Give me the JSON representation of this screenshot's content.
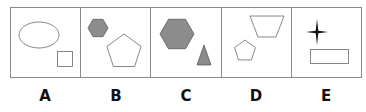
{
  "figure": {
    "type": "shape-sequence-puzzle",
    "frame": {
      "x": 10,
      "y": 7,
      "width": 351,
      "height": 70,
      "stroke": "#888888"
    },
    "colors": {
      "outline": "#7a7a7a",
      "fill_gray": "#8c8c8c",
      "fill_dark_outline": "#5a5a5a",
      "star": "#111111"
    },
    "panels": [
      {
        "label": "A",
        "shapes": [
          {
            "kind": "ellipse",
            "fill": "none",
            "cx": 29,
            "cy": 28,
            "rx": 20,
            "ry": 13
          },
          {
            "kind": "square",
            "fill": "none",
            "x": 47,
            "y": 44,
            "size": 15
          }
        ]
      },
      {
        "label": "B",
        "shapes": [
          {
            "kind": "hexagon",
            "fill": "gray",
            "cx": 18,
            "cy": 21,
            "r": 10
          },
          {
            "kind": "pentagon",
            "fill": "none",
            "cx": 44,
            "cy": 45,
            "r": 18
          }
        ]
      },
      {
        "label": "C",
        "shapes": [
          {
            "kind": "hexagon",
            "fill": "gray",
            "cx": 27,
            "cy": 27,
            "r": 17
          },
          {
            "kind": "triangle",
            "fill": "gray",
            "points": [
              [
                54,
                38
              ],
              [
                47,
                58
              ],
              [
                61,
                58
              ]
            ]
          }
        ]
      },
      {
        "label": "D",
        "shapes": [
          {
            "kind": "trapezoid",
            "fill": "none",
            "points": [
              [
                29,
                9
              ],
              [
                63,
                9
              ],
              [
                55,
                30
              ],
              [
                37,
                30
              ]
            ]
          },
          {
            "kind": "pentagon",
            "fill": "none",
            "cx": 24,
            "cy": 44,
            "r": 11
          }
        ]
      },
      {
        "label": "E",
        "shapes": [
          {
            "kind": "star4",
            "fill": "black",
            "cx": 26,
            "cy": 25,
            "rx": 11,
            "ry": 13
          },
          {
            "kind": "rectangle",
            "fill": "none",
            "x": 19,
            "y": 42,
            "width": 38,
            "height": 14
          }
        ]
      }
    ]
  },
  "labels": [
    "A",
    "B",
    "C",
    "D",
    "E"
  ]
}
